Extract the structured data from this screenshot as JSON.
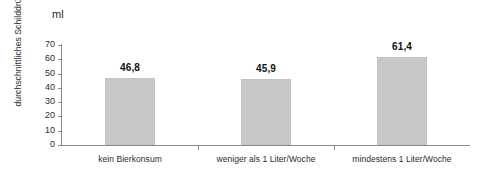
{
  "chart_data": {
    "type": "bar",
    "title": "",
    "subtitle": "",
    "unit_label": "ml",
    "categories": [
      "kein Bierkonsum",
      "weniger als 1 Liter/Woche",
      "mindestens 1 Liter/Woche"
    ],
    "values": [
      46.8,
      45.9,
      61.4
    ],
    "value_labels": [
      "46,8",
      "45,9",
      "61,4"
    ],
    "xlabel": "",
    "ylabel": "durchschnittliches Schilddrüsenvolumen",
    "ylim": [
      0,
      70
    ],
    "yticks": [
      0,
      10,
      20,
      30,
      40,
      50,
      60,
      70
    ],
    "ytick_labels": [
      "0",
      "10",
      "20",
      "30",
      "40",
      "50",
      "60",
      "70"
    ],
    "grid": false,
    "legend": false,
    "legend_position": "none",
    "bar_color": "#c8c8c8",
    "axis_color": "#8a8a8a",
    "text_color": "#2b2b2b",
    "background": "#ffffff"
  }
}
